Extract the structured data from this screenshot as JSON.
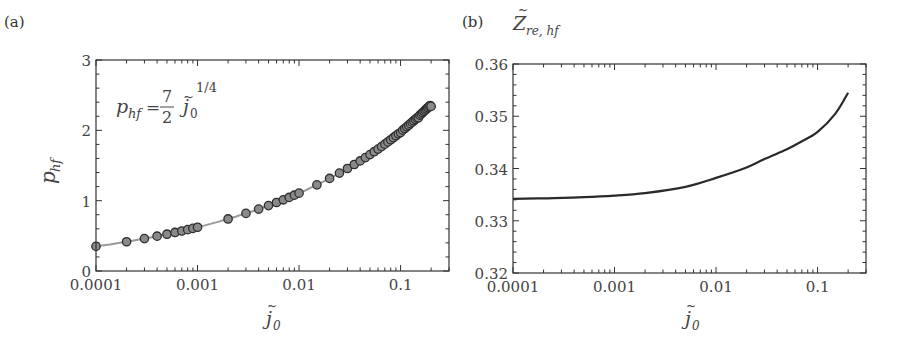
{
  "chart_data": [
    {
      "panel": "(a)",
      "type": "line",
      "title": "",
      "xlabel": "j̃0",
      "ylabel": "p_hf",
      "xscale": "log",
      "xlim": [
        0.0001,
        0.3
      ],
      "ylim": [
        0,
        3
      ],
      "grid": false,
      "x_ticks": [
        0.0001,
        0.001,
        0.01,
        0.1
      ],
      "x_tick_labels": [
        "0.0001",
        "0.001",
        "0.01",
        "0.1"
      ],
      "y_ticks": [
        0,
        1,
        2,
        3
      ],
      "y_tick_labels": [
        "0",
        "1",
        "2",
        "3"
      ],
      "annotation": "p_hf = 7/2 j̃0^(1/4)",
      "series": [
        {
          "name": "fit: p_hf = 3.5 * j0^0.25",
          "style": "gray line",
          "x": [
            0.0001,
            0.0002,
            0.0005,
            0.001,
            0.002,
            0.005,
            0.01,
            0.02,
            0.05,
            0.1,
            0.15,
            0.2
          ],
          "values": [
            0.35,
            0.416,
            0.523,
            0.622,
            0.74,
            0.93,
            1.107,
            1.316,
            1.655,
            1.968,
            2.178,
            2.34
          ]
        },
        {
          "name": "computed",
          "style": "circle markers",
          "x": [
            0.0001,
            0.0002,
            0.0003,
            0.0004,
            0.0005,
            0.0006,
            0.0007,
            0.0008,
            0.0009,
            0.001,
            0.002,
            0.003,
            0.004,
            0.005,
            0.006,
            0.007,
            0.008,
            0.009,
            0.01,
            0.015,
            0.02,
            0.025,
            0.03,
            0.035,
            0.04,
            0.045,
            0.05,
            0.055,
            0.06,
            0.065,
            0.07,
            0.075,
            0.08,
            0.085,
            0.09,
            0.095,
            0.1,
            0.105,
            0.11,
            0.115,
            0.12,
            0.125,
            0.13,
            0.135,
            0.14,
            0.145,
            0.15,
            0.155,
            0.16,
            0.165,
            0.17,
            0.175,
            0.18,
            0.185,
            0.19,
            0.195,
            0.2
          ],
          "values": [
            0.35,
            0.416,
            0.461,
            0.495,
            0.523,
            0.548,
            0.569,
            0.588,
            0.606,
            0.622,
            0.74,
            0.819,
            0.88,
            0.93,
            0.974,
            1.012,
            1.046,
            1.078,
            1.107,
            1.225,
            1.316,
            1.392,
            1.457,
            1.514,
            1.565,
            1.612,
            1.655,
            1.696,
            1.733,
            1.769,
            1.803,
            1.835,
            1.866,
            1.895,
            1.923,
            1.95,
            1.968,
            2.002,
            2.026,
            2.05,
            2.072,
            2.095,
            2.116,
            2.137,
            2.157,
            2.177,
            2.178,
            2.216,
            2.234,
            2.252,
            2.27,
            2.287,
            2.304,
            2.321,
            2.337,
            2.353,
            2.34
          ]
        }
      ]
    },
    {
      "panel": "(b)",
      "type": "line",
      "title": "",
      "xlabel": "j̃0",
      "ylabel": "Z̃_re,hf",
      "xscale": "log",
      "xlim": [
        0.0001,
        0.3
      ],
      "ylim": [
        0.32,
        0.36
      ],
      "grid": false,
      "x_ticks": [
        0.0001,
        0.001,
        0.01,
        0.1
      ],
      "x_tick_labels": [
        "0.0001",
        "0.001",
        "0.01",
        "0.1"
      ],
      "y_ticks": [
        0.32,
        0.33,
        0.34,
        0.35,
        0.36
      ],
      "y_tick_labels": [
        "0.32",
        "0.33",
        "0.34",
        "0.35",
        "0.36"
      ],
      "series": [
        {
          "name": "Z_re,hf",
          "style": "dark line",
          "x": [
            0.0001,
            0.0002,
            0.0005,
            0.001,
            0.002,
            0.005,
            0.01,
            0.02,
            0.03,
            0.05,
            0.07,
            0.1,
            0.15,
            0.2
          ],
          "values": [
            0.3342,
            0.3343,
            0.3345,
            0.3348,
            0.3353,
            0.3365,
            0.3382,
            0.3402,
            0.3418,
            0.3437,
            0.3452,
            0.347,
            0.3505,
            0.3545
          ]
        }
      ]
    }
  ],
  "labels": {
    "panel_a": "(a)",
    "panel_b": "(b)",
    "a_ylabel_main": "p",
    "a_ylabel_sub": "hf",
    "b_ylabel_main": "Z",
    "b_ylabel_sub": "re, hf",
    "xlabel_main": "j",
    "xlabel_sub": "0",
    "tilde": "~",
    "eq_lhs_main": "p",
    "eq_lhs_sub": "hf",
    "eq_equals": "=",
    "eq_num": "7",
    "eq_den": "2",
    "eq_var": "j",
    "eq_var_sub": "0",
    "eq_exp": "1/4"
  },
  "colors": {
    "axis": "#333333",
    "fit_line": "#9a9a9a",
    "marker_fill": "#8a8a8a",
    "marker_stroke": "#2e2e2e",
    "curve_b": "#2a2a2a"
  }
}
